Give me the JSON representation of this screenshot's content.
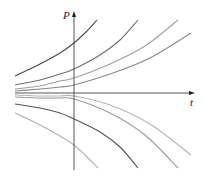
{
  "figure": {
    "axes": {
      "vertical_label": "P",
      "horizontal_label": "t",
      "origin": [
        74,
        93
      ],
      "vertical_axis": {
        "x": 74,
        "y_top": 13,
        "y_bottom": 170
      },
      "horizontal_axis": {
        "y": 93,
        "x_left": 15,
        "x_right": 193
      }
    },
    "curves": [
      {
        "name": "curve-upper-1",
        "color": "#4a4a4a",
        "points": [
          [
            15,
            76
          ],
          [
            40,
            64
          ],
          [
            60,
            53
          ],
          [
            74,
            43
          ],
          [
            86,
            32
          ],
          [
            97,
            20
          ]
        ]
      },
      {
        "name": "curve-upper-2",
        "color": "#6e6e6e",
        "points": [
          [
            15,
            85
          ],
          [
            40,
            80
          ],
          [
            60,
            74
          ],
          [
            74,
            69
          ],
          [
            100,
            55
          ],
          [
            120,
            40
          ],
          [
            138,
            20
          ]
        ]
      },
      {
        "name": "curve-upper-3",
        "color": "#a0a0a0",
        "points": [
          [
            15,
            89
          ],
          [
            40,
            86
          ],
          [
            60,
            81
          ],
          [
            74,
            78
          ],
          [
            110,
            64
          ],
          [
            145,
            46
          ],
          [
            178,
            20
          ]
        ]
      },
      {
        "name": "curve-upper-4",
        "color": "#8a8a8a",
        "points": [
          [
            15,
            91
          ],
          [
            40,
            89
          ],
          [
            60,
            87
          ],
          [
            74,
            85
          ],
          [
            110,
            74
          ],
          [
            150,
            58
          ],
          [
            191,
            33
          ]
        ]
      },
      {
        "name": "curve-lower-4",
        "color": "#b5b5b5",
        "points": [
          [
            15,
            95
          ],
          [
            40,
            96
          ],
          [
            60,
            96
          ],
          [
            74,
            96
          ],
          [
            110,
            105
          ],
          [
            150,
            124
          ],
          [
            191,
            155
          ]
        ]
      },
      {
        "name": "curve-lower-3",
        "color": "#9a9a9a",
        "points": [
          [
            15,
            97
          ],
          [
            40,
            98
          ],
          [
            60,
            98
          ],
          [
            74,
            99
          ],
          [
            110,
            113
          ],
          [
            145,
            135
          ],
          [
            178,
            168
          ]
        ]
      },
      {
        "name": "curve-lower-2",
        "color": "#555555",
        "points": [
          [
            15,
            104
          ],
          [
            40,
            108
          ],
          [
            60,
            113
          ],
          [
            74,
            119
          ],
          [
            100,
            132
          ],
          [
            120,
            147
          ],
          [
            138,
            168
          ]
        ]
      },
      {
        "name": "curve-lower-1",
        "color": "#b0b0b0",
        "points": [
          [
            15,
            113
          ],
          [
            40,
            125
          ],
          [
            60,
            136
          ],
          [
            74,
            145
          ],
          [
            86,
            156
          ],
          [
            98,
            168
          ]
        ]
      }
    ]
  }
}
